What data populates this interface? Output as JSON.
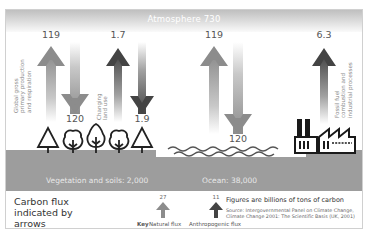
{
  "diagram": {
    "title": "Carbon flux indicated by arrows",
    "atmosphere": {
      "label": "Atmosphere 730",
      "value": 730
    },
    "reservoirs": [
      {
        "name": "Vegetation and soils",
        "label": "Vegetation and soils: 2,000",
        "value": 2000
      },
      {
        "name": "Ocean",
        "label": "Ocean: 38,000",
        "value": 38000
      }
    ],
    "fluxes": [
      {
        "label_lines": [
          "Global gross",
          "primary production",
          "and respiration"
        ],
        "up": "119",
        "down": "120",
        "type": "natural"
      },
      {
        "label_lines": [
          "Changing",
          "land use"
        ],
        "up": "1.7",
        "down": "1.9",
        "type": "anthropogenic"
      },
      {
        "label_lines": [],
        "up": "119",
        "down": "120",
        "type": "natural"
      },
      {
        "label_lines": [
          "Fossil fuel",
          "combustion and",
          "industrial processes"
        ],
        "up": "6.3",
        "down": null,
        "type": "anthropogenic"
      }
    ],
    "key": {
      "label": "Key",
      "natural": {
        "label": "Natural flux",
        "example_value": "27"
      },
      "anthropogenic": {
        "label": "Anthropogenic flux",
        "example_value": "11"
      }
    },
    "units_note": "Figures are billions of tons of carbon",
    "source": "Source: Intergovernmental Panel on Climate Change, Climate Change 2001: The Scientific Basis (UK, 2001)",
    "icons": [
      "tree-icon",
      "factory-icon",
      "wave-icon"
    ],
    "colors": {
      "natural_arrow": "#8c8c8c",
      "anthropogenic_arrow": "#4a4a4a",
      "ground": "#9d9d9d",
      "atmosphere_bar": "#cfcfcf"
    }
  }
}
